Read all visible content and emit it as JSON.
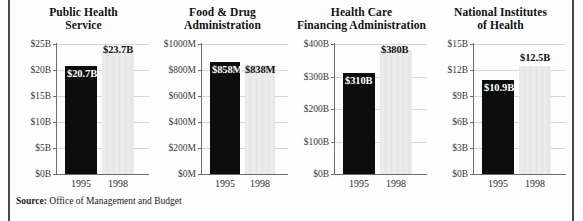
{
  "figure": {
    "source_label": "Source:",
    "source_text": "Office of Management and Budget",
    "frame_color": "#4a4a4a",
    "bar_1995_color": "#0d0d0d",
    "bar_1998_color": "#ececec"
  },
  "chart_data": [
    {
      "type": "bar",
      "title": "Public Health\nService",
      "title_line1": "Public Health",
      "title_line2": "Service",
      "categories": [
        "1995",
        "1998"
      ],
      "values": [
        20.7,
        23.7
      ],
      "value_labels": [
        "$20.7B",
        "$23.7B"
      ],
      "xlabel": "",
      "ylabel": "",
      "ylim": [
        0,
        25
      ],
      "ticks": [
        0,
        5,
        10,
        15,
        20,
        25
      ],
      "tick_labels": [
        "$0B",
        "$5B",
        "$10B",
        "$15B",
        "$20B",
        "$25B"
      ],
      "grid": true,
      "legend": "none"
    },
    {
      "type": "bar",
      "title": "Food & Drug\nAdministration",
      "title_line1": "Food & Drug",
      "title_line2": "Administration",
      "categories": [
        "1995",
        "1998"
      ],
      "values": [
        858,
        838
      ],
      "value_labels": [
        "$858M",
        "$838M"
      ],
      "xlabel": "",
      "ylabel": "",
      "ylim": [
        0,
        1000
      ],
      "ticks": [
        0,
        200,
        400,
        600,
        800,
        1000
      ],
      "tick_labels": [
        "$0M",
        "$200M",
        "$400M",
        "$600M",
        "$800M",
        "$1000M"
      ],
      "grid": true,
      "legend": "none"
    },
    {
      "type": "bar",
      "title": "Health Care\nFinancing Administration",
      "title_line1": "Health Care",
      "title_line2": "Financing Administration",
      "categories": [
        "1995",
        "1998"
      ],
      "values": [
        310,
        380
      ],
      "value_labels": [
        "$310B",
        "$380B"
      ],
      "xlabel": "",
      "ylabel": "",
      "ylim": [
        0,
        400
      ],
      "ticks": [
        0,
        100,
        200,
        300,
        400
      ],
      "tick_labels": [
        "$0B",
        "$100B",
        "$200B",
        "$300B",
        "$400B"
      ],
      "grid": true,
      "legend": "none"
    },
    {
      "type": "bar",
      "title": "National Institutes\nof Health",
      "title_line1": "National Institutes",
      "title_line2": "of Health",
      "categories": [
        "1995",
        "1998"
      ],
      "values": [
        10.9,
        12.5
      ],
      "value_labels": [
        "$10.9B",
        "$12.5B"
      ],
      "xlabel": "",
      "ylabel": "",
      "ylim": [
        0,
        15
      ],
      "ticks": [
        0,
        3,
        6,
        9,
        12,
        15
      ],
      "tick_labels": [
        "$0B",
        "$3B",
        "$6B",
        "$9B",
        "$12B",
        "$15B"
      ],
      "grid": true,
      "legend": "none"
    }
  ]
}
